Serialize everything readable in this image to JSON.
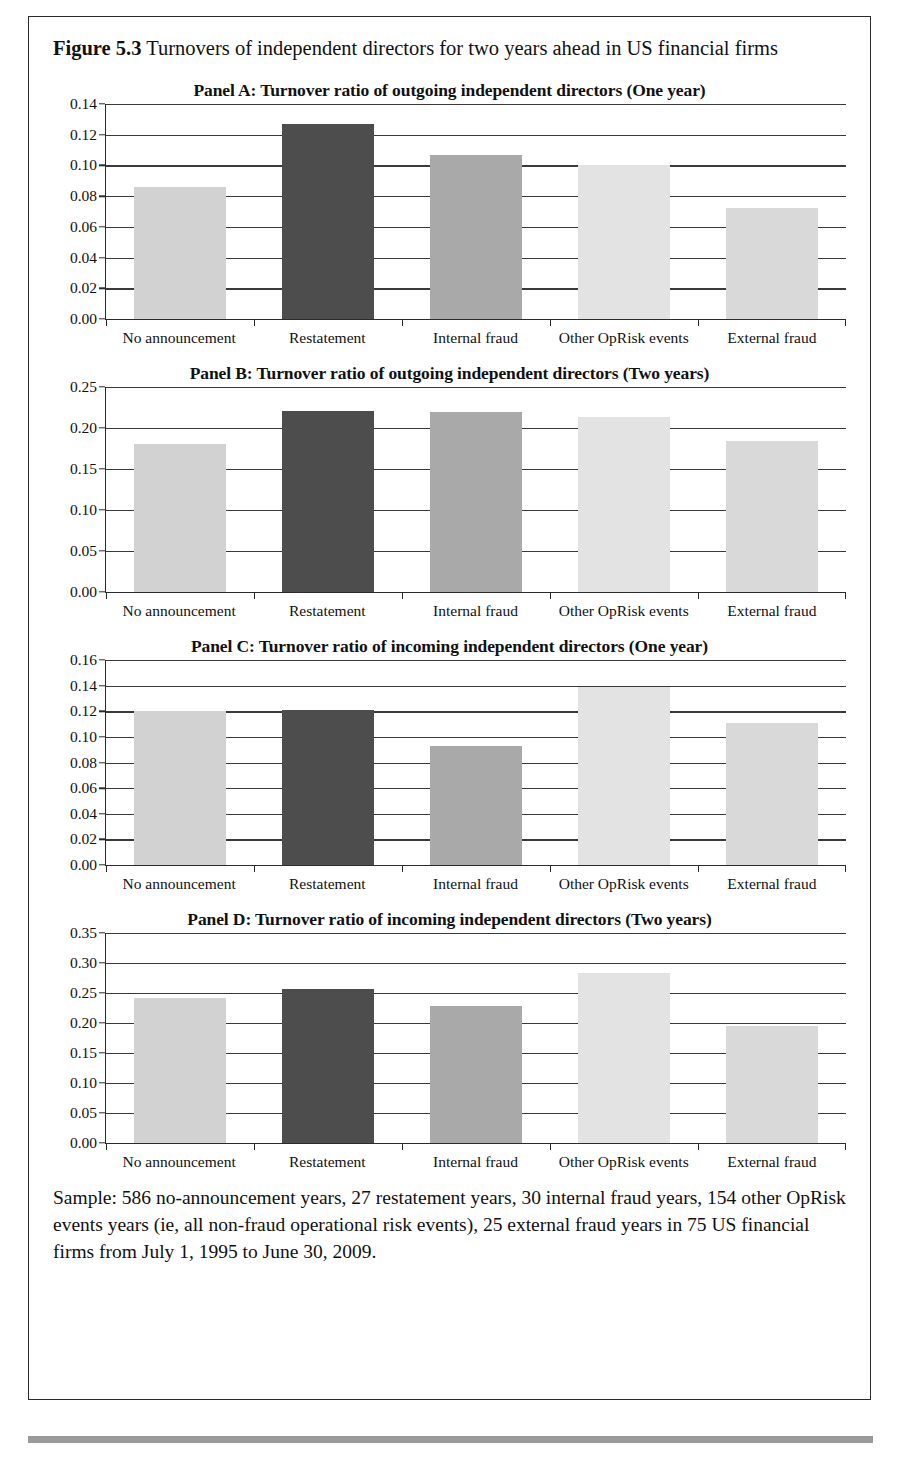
{
  "figure": {
    "label": "Figure",
    "number": "5.3",
    "caption": "Turnovers of independent directors for two years ahead in US financial firms",
    "note": "Sample: 586 no-announcement years, 27 restatement years, 30 internal fraud years, 154 other OpRisk events years (ie, all non-fraud operational risk events), 25 external fraud years in 75 US financial firms from July 1, 1995 to June 30, 2009."
  },
  "colors": {
    "bar_no_announcement": "#d2d2d2",
    "bar_restatement": "#4d4d4d",
    "bar_internal_fraud": "#a9a9a9",
    "bar_other_oprisk": "#e3e3e3",
    "bar_external_fraud": "#d9d9d9",
    "axis": "#2b2b2b",
    "gridline": "#3a3a3a",
    "page_rule": "#9a9a9a"
  },
  "chart_data": [
    {
      "type": "bar",
      "panel": "Panel A",
      "title": "Panel A: Turnover ratio of outgoing independent directors (One year)",
      "categories": [
        "No announcement",
        "Restatement",
        "Internal fraud",
        "Other OpRisk events",
        "External fraud"
      ],
      "values": [
        0.086,
        0.127,
        0.107,
        0.1,
        0.072
      ],
      "xlabel": "",
      "ylabel": "",
      "ylim": [
        0.0,
        0.14
      ],
      "yticks": [
        "0.00",
        "0.02",
        "0.04",
        "0.06",
        "0.08",
        "0.10",
        "0.12",
        "0.14"
      ],
      "ytick_values": [
        0.0,
        0.02,
        0.04,
        0.06,
        0.08,
        0.1,
        0.12,
        0.14
      ],
      "grid": true,
      "legend": "none"
    },
    {
      "type": "bar",
      "panel": "Panel B",
      "title": "Panel B: Turnover ratio of outgoing independent directors (Two years)",
      "categories": [
        "No announcement",
        "Restatement",
        "Internal fraud",
        "Other OpRisk events",
        "External fraud"
      ],
      "values": [
        0.18,
        0.221,
        0.219,
        0.213,
        0.184
      ],
      "xlabel": "",
      "ylabel": "",
      "ylim": [
        0.0,
        0.25
      ],
      "yticks": [
        "0.00",
        "0.05",
        "0.10",
        "0.15",
        "0.20",
        "0.25"
      ],
      "ytick_values": [
        0.0,
        0.05,
        0.1,
        0.15,
        0.2,
        0.25
      ],
      "grid": true,
      "legend": "none"
    },
    {
      "type": "bar",
      "panel": "Panel C",
      "title": "Panel C: Turnover ratio of incoming independent directors (One year)",
      "categories": [
        "No announcement",
        "Restatement",
        "Internal fraud",
        "Other OpRisk events",
        "External fraud"
      ],
      "values": [
        0.12,
        0.121,
        0.093,
        0.139,
        0.111
      ],
      "xlabel": "",
      "ylabel": "",
      "ylim": [
        0.0,
        0.16
      ],
      "yticks": [
        "0.00",
        "0.02",
        "0.04",
        "0.06",
        "0.08",
        "0.10",
        "0.12",
        "0.14",
        "0.16"
      ],
      "ytick_values": [
        0.0,
        0.02,
        0.04,
        0.06,
        0.08,
        0.1,
        0.12,
        0.14,
        0.16
      ],
      "grid": true,
      "legend": "none"
    },
    {
      "type": "bar",
      "panel": "Panel D",
      "title": "Panel D: Turnover ratio of incoming independent directors (Two years)",
      "categories": [
        "No announcement",
        "Restatement",
        "Internal fraud",
        "Other OpRisk events",
        "External fraud"
      ],
      "values": [
        0.241,
        0.256,
        0.229,
        0.283,
        0.195
      ],
      "xlabel": "",
      "ylabel": "",
      "ylim": [
        0.0,
        0.35
      ],
      "yticks": [
        "0.00",
        "0.05",
        "0.10",
        "0.15",
        "0.20",
        "0.25",
        "0.30",
        "0.35"
      ],
      "ytick_values": [
        0.0,
        0.05,
        0.1,
        0.15,
        0.2,
        0.25,
        0.3,
        0.35
      ],
      "grid": true,
      "legend": "none"
    }
  ]
}
